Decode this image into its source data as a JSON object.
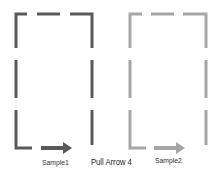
{
  "title": "Pull Arrow 4",
  "colors": {
    "dark": "#5a5a5a",
    "light": "#a6a6a6"
  },
  "samples": [
    {
      "label": "Sample1",
      "color": "#5a5a5a"
    },
    {
      "label": "Sample2",
      "color": "#a6a6a6"
    }
  ],
  "caption": "Pull Arrow 4"
}
